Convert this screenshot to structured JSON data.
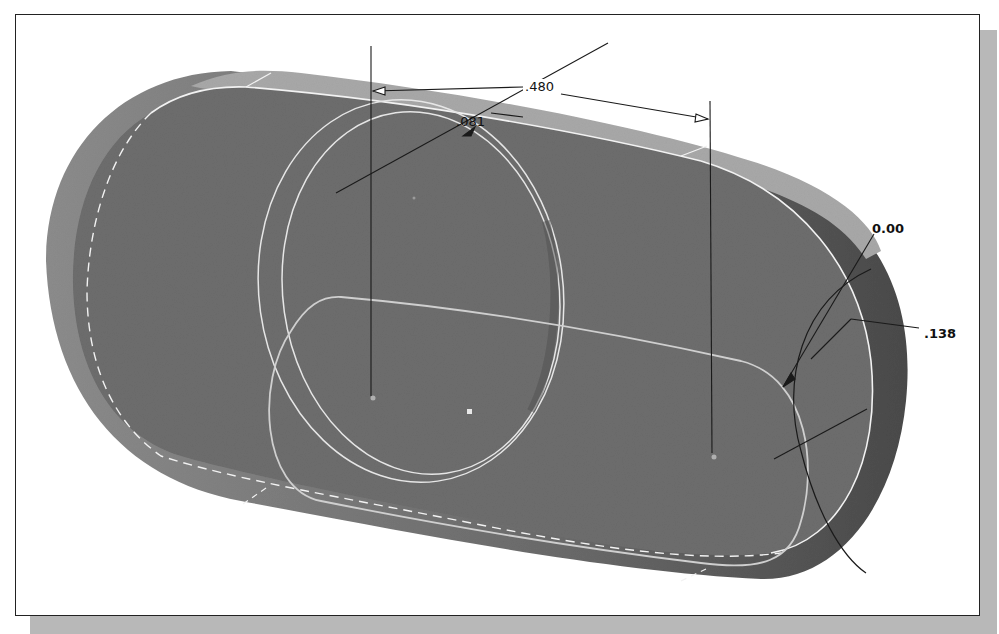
{
  "viewport": {
    "description": "3D CAD model view of slotted extrusion with sketch dimensions"
  },
  "dimensions": {
    "linear_480": ".480",
    "diameter_081": ".081",
    "angle_000": "0.00",
    "radius_138": ".138"
  },
  "colors": {
    "face_dark": "#6e6e6e",
    "face_side_light": "#a6a6a6",
    "face_side_dark": "#555555",
    "edge_white": "#f0f0f0",
    "sketch_line": "#c8c8c8",
    "dimension_line": "#1a1a1a",
    "background": "#ffffff",
    "frame_shadow": "#b8b8b8"
  }
}
